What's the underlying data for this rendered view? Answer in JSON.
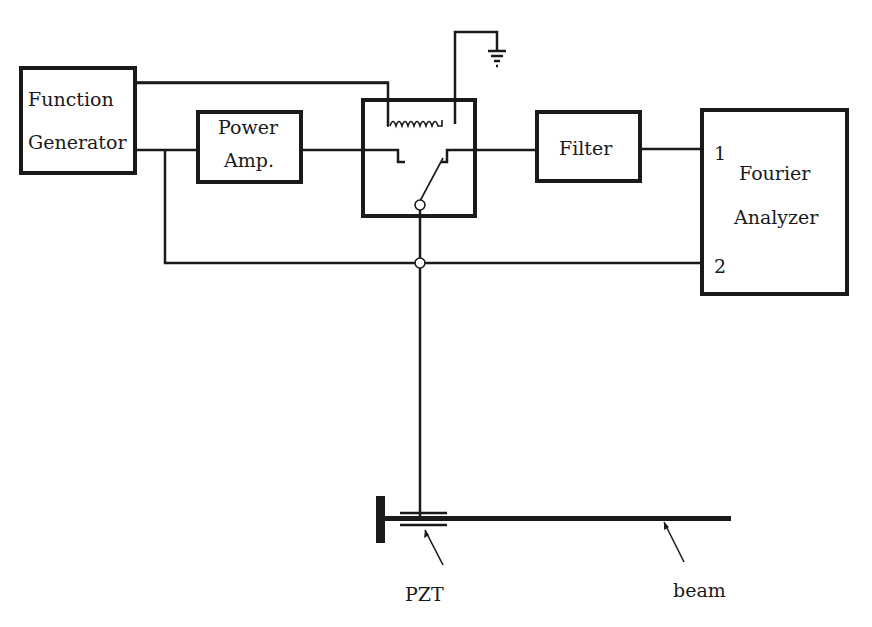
{
  "diagram": {
    "blocks": {
      "function_generator": {
        "line1": "Function",
        "line2": "Generator"
      },
      "power_amp": {
        "line1": "Power",
        "line2": "Amp."
      },
      "switch_relay": {
        "label": ""
      },
      "filter": {
        "label": "Filter"
      },
      "fourier_analyzer": {
        "line1": "Fourier",
        "line2": "Analyzer",
        "input1": "1",
        "input2": "2"
      }
    },
    "annotations": {
      "pzt": "PZT",
      "beam": "beam"
    },
    "colors": {
      "ink": "#1a1a1a",
      "background": "#ffffff"
    }
  }
}
